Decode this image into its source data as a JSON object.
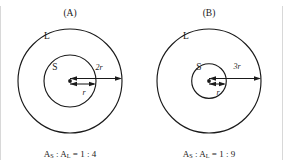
{
  "figure": {
    "width": 283,
    "height": 166,
    "background_color": "#ffffff",
    "ink_color": "#1a1a1a"
  },
  "panels": [
    {
      "id": "panel-a",
      "title": "(A)",
      "outer_region_label": "L",
      "inner_region_label": "S",
      "inner_radius_label": "r",
      "outer_radius_label": "2r",
      "ratio_caption": {
        "a_prefix": "A",
        "a_sub": "S",
        "separator": " : ",
        "b_prefix": "A",
        "b_sub": "L",
        "equals": " = ",
        "value": "1 : 4",
        "full_text": "A S : A L = 1 : 4"
      },
      "geometry": {
        "center_x": 70,
        "center_y": 81,
        "outer_radius": 52,
        "inner_radius": 26,
        "radius_ratio": "1 : 2",
        "area_ratio": "1 : 4"
      }
    },
    {
      "id": "panel-b",
      "title": "(B)",
      "outer_region_label": "L",
      "inner_region_label": "S",
      "inner_radius_label": "r",
      "outer_radius_label": "3r",
      "ratio_caption": {
        "a_prefix": "A",
        "a_sub": "S",
        "separator": " : ",
        "b_prefix": "A",
        "b_sub": "L",
        "equals": " = ",
        "value": "1 : 9",
        "full_text": "A S : A L = 1 : 9"
      },
      "geometry": {
        "center_x": 209,
        "center_y": 81,
        "outer_radius": 52,
        "inner_radius": 17.3,
        "radius_ratio": "1 : 3",
        "area_ratio": "1 : 9"
      }
    }
  ]
}
